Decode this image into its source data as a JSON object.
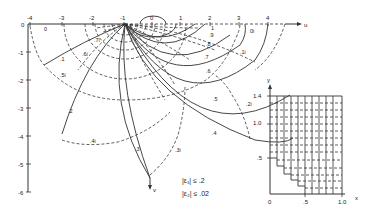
{
  "main_plot": {
    "u_axis_label": "u",
    "v_axis_label": "v",
    "u_ticks": [
      "-4",
      "-3",
      "-2",
      "-1",
      "0",
      "1",
      "2",
      "3",
      "4"
    ],
    "v_ticks": [
      "0",
      "-1",
      "-2",
      "-3",
      "-4",
      "-5",
      "-6"
    ],
    "solid_curve_labels": [
      ".1",
      ".2",
      ".3",
      ".4",
      ".5",
      ".6",
      ".7",
      ".8",
      ".9",
      "1"
    ],
    "dashed_curve_labels": [
      "0",
      "0i",
      ".1i",
      ".2i",
      ".3i",
      ".4i",
      ".5i",
      ".6i",
      ".7i"
    ],
    "error_bounds": {
      "line1": "|ε₁| ≤ .2",
      "line2": "|ε₂| ≤ .02"
    }
  },
  "inset_plot": {
    "x_axis_label": "x",
    "y_axis_label": "y",
    "x_ticks": [
      "0",
      ".5",
      "1.0"
    ],
    "y_ticks": [
      ".5",
      "1.0",
      "1.4"
    ]
  }
}
